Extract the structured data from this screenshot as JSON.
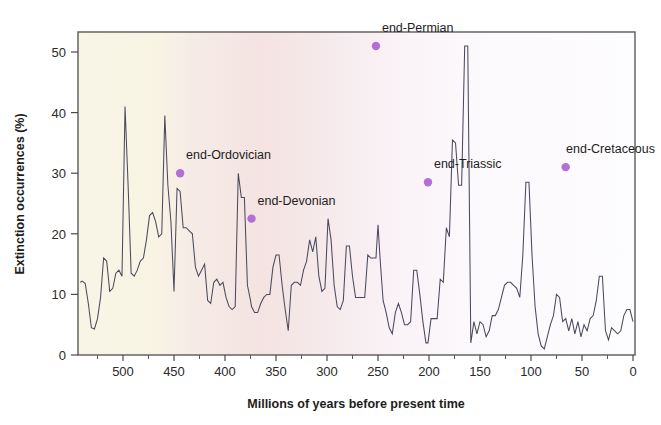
{
  "chart_data": {
    "type": "line",
    "title": "",
    "xlabel": "Millions of years before present time",
    "ylabel": "Extinction occurrences (%)",
    "xlim": [
      542,
      0
    ],
    "ylim": [
      0,
      54
    ],
    "x_axis_reversed": true,
    "grid": false,
    "legend": "none",
    "xticks": [
      500,
      450,
      400,
      350,
      300,
      250,
      200,
      150,
      100,
      50,
      0
    ],
    "xtick_labels": [
      "500",
      "450",
      "400",
      "350",
      "300",
      "250",
      "200",
      "150",
      "100",
      "50",
      "0"
    ],
    "x_minor_tick_interval": 25,
    "yticks": [
      0,
      10,
      20,
      30,
      40,
      50
    ],
    "ytick_labels": [
      "0",
      "10",
      "20",
      "30",
      "40",
      "50"
    ],
    "series_name": "Extinction occurrences",
    "line_color": "#4a4a5e",
    "background_zones": [
      {
        "name": "early-paleozoic-cream",
        "from_ma": 542,
        "to_ma": 460,
        "color": "#f7f4e4"
      },
      {
        "name": "mid-paleozoic-pink",
        "from_ma": 460,
        "to_ma": 360,
        "color": "#f6e7e4"
      },
      {
        "name": "late-mesozoic-cenozoic-white",
        "from_ma": 360,
        "to_ma": 0,
        "color": "#fcfbfd"
      }
    ],
    "annotations": [
      {
        "label": "end-Ordovician",
        "x": 444,
        "y": 30.0,
        "marker_color": "#b46fd4",
        "label_dx": 6,
        "label_dy": -14,
        "anchor": "start"
      },
      {
        "label": "end-Devonian",
        "x": 374,
        "y": 22.5,
        "marker_color": "#b46fd4",
        "label_dx": 6,
        "label_dy": -14,
        "anchor": "start"
      },
      {
        "label": "end-Permian",
        "x": 252,
        "y": 51.0,
        "marker_color": "#b46fd4",
        "label_dx": 6,
        "label_dy": -14,
        "anchor": "start"
      },
      {
        "label": "end-Triassic",
        "x": 201,
        "y": 28.5,
        "marker_color": "#b46fd4",
        "label_dx": 6,
        "label_dy": -14,
        "anchor": "start"
      },
      {
        "label": "end-Cretaceous",
        "x": 66,
        "y": 31.0,
        "marker_color": "#b46fd4",
        "label_dx": 6,
        "label_dy": -14,
        "anchor": "start"
      }
    ],
    "x": [
      542,
      540,
      537,
      534,
      531,
      528,
      525,
      522,
      519,
      516,
      513,
      510,
      507,
      504,
      501,
      498,
      495,
      492,
      489,
      486,
      483,
      480,
      477,
      474,
      471,
      468,
      465,
      462,
      459,
      456,
      453,
      450,
      447,
      444,
      441,
      438,
      435,
      432,
      429,
      426,
      423,
      420,
      417,
      414,
      411,
      408,
      405,
      402,
      399,
      396,
      393,
      390,
      387,
      384,
      381,
      378,
      375,
      374,
      371,
      368,
      365,
      362,
      359,
      356,
      353,
      350,
      347,
      344,
      341,
      338,
      335,
      332,
      329,
      326,
      323,
      320,
      317,
      314,
      311,
      308,
      305,
      302,
      299,
      296,
      293,
      290,
      287,
      284,
      281,
      278,
      275,
      272,
      269,
      266,
      263,
      260,
      257,
      254,
      252,
      250,
      248,
      245,
      242,
      239,
      236,
      233,
      230,
      227,
      224,
      221,
      218,
      215,
      212,
      209,
      206,
      203,
      201,
      198,
      195,
      192,
      189,
      186,
      183,
      180,
      177,
      174,
      171,
      168,
      165,
      162,
      159,
      156,
      153,
      150,
      147,
      144,
      141,
      138,
      135,
      132,
      129,
      126,
      123,
      120,
      117,
      114,
      111,
      108,
      105,
      102,
      99,
      96,
      93,
      90,
      87,
      84,
      81,
      78,
      75,
      72,
      69,
      66,
      63,
      60,
      57,
      54,
      51,
      48,
      45,
      42,
      39,
      36,
      33,
      30,
      27,
      24,
      21,
      18,
      15,
      12,
      9,
      6,
      3,
      0
    ],
    "y": [
      12.0,
      12.2,
      11.8,
      8.5,
      4.5,
      4.3,
      6.0,
      9.5,
      16.0,
      15.5,
      10.5,
      11.0,
      13.5,
      14.0,
      13.0,
      41.0,
      28.0,
      13.5,
      13.0,
      14.0,
      15.5,
      16.0,
      19.0,
      23.0,
      23.5,
      22.0,
      19.5,
      20.0,
      39.5,
      28.0,
      22.0,
      10.5,
      27.5,
      27.0,
      21.0,
      21.0,
      20.5,
      20.0,
      14.5,
      13.0,
      14.0,
      15.0,
      9.0,
      8.5,
      12.0,
      12.5,
      11.5,
      12.0,
      9.5,
      8.0,
      7.5,
      8.0,
      30.0,
      26.0,
      26.0,
      11.5,
      9.0,
      8.0,
      7.0,
      7.0,
      8.5,
      9.5,
      10.0,
      10.0,
      14.5,
      16.5,
      16.5,
      11.5,
      7.5,
      4.0,
      11.5,
      12.0,
      12.0,
      11.5,
      14.0,
      15.5,
      19.0,
      17.0,
      19.5,
      13.0,
      10.5,
      11.0,
      22.5,
      19.0,
      11.5,
      8.0,
      7.5,
      9.0,
      18.0,
      18.0,
      13.0,
      9.5,
      9.5,
      9.5,
      9.5,
      16.5,
      16.0,
      16.0,
      16.0,
      21.5,
      16.0,
      9.0,
      7.0,
      4.5,
      3.5,
      7.0,
      8.5,
      7.0,
      5.0,
      5.0,
      5.5,
      14.0,
      14.0,
      10.0,
      5.5,
      2.0,
      2.0,
      6.0,
      6.0,
      6.0,
      12.5,
      12.0,
      21.0,
      19.5,
      35.5,
      35.0,
      28.0,
      28.0,
      51.0,
      51.0,
      2.0,
      5.5,
      3.5,
      5.5,
      5.0,
      3.0,
      4.0,
      6.5,
      6.5,
      7.5,
      9.5,
      11.5,
      12.0,
      12.0,
      11.5,
      11.0,
      9.5,
      16.5,
      28.5,
      28.5,
      16.5,
      8.0,
      3.5,
      1.5,
      1.0,
      3.0,
      5.0,
      6.5,
      10.0,
      9.5,
      5.5,
      6.0,
      4.0,
      6.0,
      3.5,
      5.5,
      3.0,
      5.0,
      4.0,
      6.0,
      6.5,
      9.0,
      13.0,
      13.0,
      4.0,
      2.5,
      4.5,
      4.0,
      3.5,
      4.0,
      6.5,
      7.5,
      7.5,
      5.5,
      5.0,
      3.5,
      4.0,
      7.5,
      7.0,
      6.0,
      7.5,
      5.5,
      2.0,
      1.0,
      2.5,
      7.0,
      7.0,
      31.0,
      31.0,
      4.0,
      3.5,
      4.5,
      3.5,
      3.0,
      3.0,
      12.0,
      12.0,
      3.0,
      2.5,
      1.5,
      1.5,
      2.0,
      5.0,
      4.5,
      2.0,
      2.0,
      3.0
    ]
  }
}
